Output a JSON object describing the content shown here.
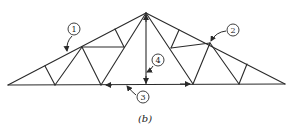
{
  "figure": {
    "caption": "(b)"
  },
  "callouts": [
    {
      "id": "1",
      "label": "1",
      "target": "top-chord-left"
    },
    {
      "id": "2",
      "label": "2",
      "target": "top-chord-right-panel-point"
    },
    {
      "id": "3",
      "label": "3",
      "target": "bottom-chord"
    },
    {
      "id": "4",
      "label": "4",
      "target": "king-post"
    }
  ],
  "colors": {
    "line": "#2a2a2a",
    "background": "#ffffff"
  }
}
